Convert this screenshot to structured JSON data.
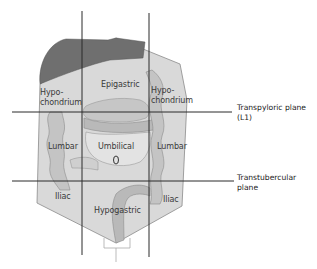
{
  "diagram": {
    "colors": {
      "background": "#ffffff",
      "torso_fill": "#d9d9d9",
      "torso_stroke": "#8a8a8a",
      "liver_fill": "#6f6f6f",
      "intestine_fill": "#bdbdbd",
      "intestine_stroke": "#8c8c8c",
      "plane_line": "#2a2a2a"
    },
    "regions": [
      {
        "id": "right-hypochondrium",
        "label": "Hypo-\nchondrium"
      },
      {
        "id": "epigastric",
        "label": "Epigastric"
      },
      {
        "id": "left-hypochondrium",
        "label": "Hypo-\nchondrium"
      },
      {
        "id": "right-lumbar",
        "label": "Lumbar"
      },
      {
        "id": "umbilical",
        "label": "Umbilical"
      },
      {
        "id": "left-lumbar",
        "label": "Lumbar"
      },
      {
        "id": "right-iliac",
        "label": "Iliac"
      },
      {
        "id": "hypogastric",
        "label": "Hypogastric"
      },
      {
        "id": "left-iliac",
        "label": "Iliac"
      }
    ],
    "planes": {
      "transpyloric": {
        "label": "Transpyloric plane\n(L1)"
      },
      "transtubercular": {
        "label": "Transtubercular\nplane"
      }
    }
  }
}
